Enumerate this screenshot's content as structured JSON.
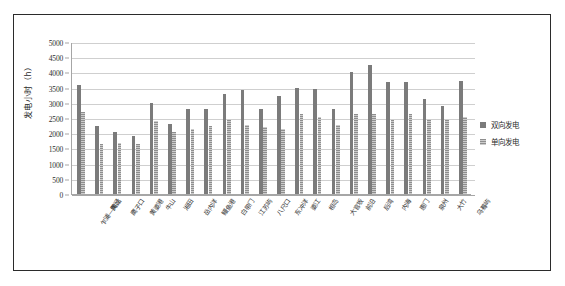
{
  "chart_data": {
    "type": "bar",
    "title": "",
    "subtitle": "",
    "xlabel": "",
    "ylabel": "发电小时（h）",
    "ylim": [
      0,
      5000
    ],
    "ytick_step": 500,
    "yticks": [
      "0",
      "500",
      "1000",
      "1500",
      "2000",
      "2500",
      "3000",
      "3500",
      "4000",
      "4500",
      "5000"
    ],
    "grid": true,
    "legend_position": "right",
    "categories": [
      "乍浦—黄姑",
      "陶泾",
      "鹰子口",
      "黄婆港",
      "牛山",
      "湘田",
      "岳内洋",
      "鳗鱼港",
      "白带门",
      "江苏屿",
      "八尺口",
      "东冲洋",
      "婆江",
      "相岛",
      "大官坂",
      "前沿",
      "后湾",
      "内海",
      "惠门",
      "泉州",
      "大竹",
      "乌蓦屿"
    ],
    "series": [
      {
        "name": "双向发电",
        "color": "#7b7b7b",
        "values": [
          3580,
          2240,
          2030,
          1920,
          2980,
          2310,
          2790,
          2790,
          3280,
          3420,
          2800,
          3220,
          3490,
          3450,
          2790,
          4000,
          4230,
          3700,
          3680,
          3110,
          2900,
          3720
        ]
      },
      {
        "name": "单向发电",
        "color": "#8e8e8e",
        "values": [
          2700,
          1630,
          1690,
          1650,
          2390,
          2040,
          2150,
          2230,
          2470,
          2260,
          2200,
          2130,
          2620,
          2540,
          2280,
          2640,
          2620,
          2450,
          2630,
          2480,
          2420,
          2540
        ]
      }
    ]
  },
  "legend": {
    "items": [
      {
        "label": "双向发电"
      },
      {
        "label": "单向发电"
      }
    ]
  }
}
